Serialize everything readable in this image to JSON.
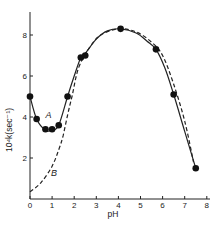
{
  "chart_data": {
    "type": "line",
    "title": "",
    "xlabel": "pH",
    "ylabel": "10⁴k(sec⁻¹)",
    "xlim": [
      0,
      8
    ],
    "ylim": [
      0,
      9
    ],
    "x_ticks": [
      0,
      1,
      2,
      3,
      4,
      5,
      6,
      7,
      8
    ],
    "x_tick_labels": [
      "0",
      "1",
      "2",
      "3",
      "4",
      "5",
      "6",
      "7",
      "8"
    ],
    "y_ticks": [
      2,
      4,
      6,
      8
    ],
    "y_tick_labels": [
      "2",
      "4",
      "6",
      "8"
    ],
    "grid": false,
    "legend": "none (curves labeled inline as A and B)",
    "series": [
      {
        "name": "A",
        "style": "solid line with filled circle markers (experimental)",
        "points": [
          {
            "x": 0.0,
            "y": 5.0
          },
          {
            "x": 0.3,
            "y": 3.9
          },
          {
            "x": 0.7,
            "y": 3.4
          },
          {
            "x": 1.0,
            "y": 3.4
          },
          {
            "x": 1.3,
            "y": 3.6
          },
          {
            "x": 1.7,
            "y": 5.0
          },
          {
            "x": 2.3,
            "y": 6.9
          },
          {
            "x": 2.5,
            "y": 7.0
          },
          {
            "x": 4.1,
            "y": 8.3
          },
          {
            "x": 5.7,
            "y": 7.3
          },
          {
            "x": 6.5,
            "y": 5.1
          },
          {
            "x": 7.5,
            "y": 1.5
          }
        ],
        "curve": [
          [
            0.0,
            5.0
          ],
          [
            0.3,
            3.9
          ],
          [
            0.7,
            3.35
          ],
          [
            1.0,
            3.35
          ],
          [
            1.3,
            3.6
          ],
          [
            1.7,
            5.0
          ],
          [
            2.0,
            6.0
          ],
          [
            2.3,
            6.9
          ],
          [
            2.5,
            7.1
          ],
          [
            3.0,
            7.8
          ],
          [
            3.5,
            8.2
          ],
          [
            4.1,
            8.3
          ],
          [
            4.8,
            8.1
          ],
          [
            5.3,
            7.7
          ],
          [
            5.7,
            7.3
          ],
          [
            6.1,
            6.4
          ],
          [
            6.5,
            5.1
          ],
          [
            7.0,
            3.3
          ],
          [
            7.5,
            1.5
          ]
        ]
      },
      {
        "name": "B",
        "style": "dashed line (calculated)",
        "curve": [
          [
            0.0,
            0.35
          ],
          [
            0.5,
            0.8
          ],
          [
            1.0,
            1.6
          ],
          [
            1.3,
            2.4
          ],
          [
            1.5,
            3.1
          ],
          [
            1.7,
            4.1
          ],
          [
            1.9,
            5.0
          ],
          [
            2.2,
            6.4
          ],
          [
            2.7,
            7.4
          ],
          [
            3.2,
            8.0
          ],
          [
            4.0,
            8.3
          ],
          [
            4.8,
            8.15
          ],
          [
            5.5,
            7.65
          ],
          [
            6.0,
            7.0
          ],
          [
            6.5,
            5.6
          ],
          [
            7.0,
            3.8
          ],
          [
            7.4,
            1.8
          ]
        ]
      }
    ],
    "annotations": [
      {
        "text": "A",
        "x": 0.7,
        "y": 3.95
      },
      {
        "text": "B",
        "x": 0.95,
        "y": 1.1
      }
    ]
  }
}
